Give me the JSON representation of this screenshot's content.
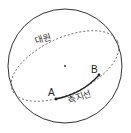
{
  "diagram": {
    "type": "sphere-geodesic",
    "labels": {
      "great_circle": "대원",
      "geodesic": "측지선",
      "point_a": "A",
      "point_b": "B"
    },
    "colors": {
      "stroke": "#333333",
      "background": "#ffffff"
    }
  }
}
